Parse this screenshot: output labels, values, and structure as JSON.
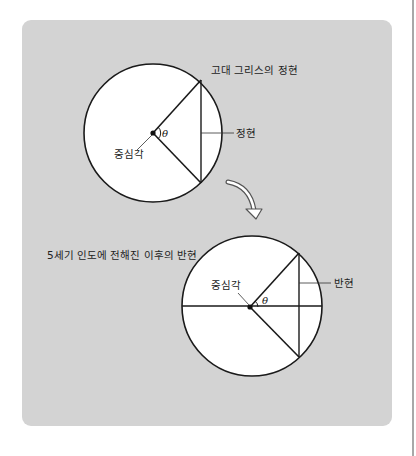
{
  "colors": {
    "page_background": "#ffffff",
    "card_background": "#d3d3d3",
    "circle_fill": "#ffffff",
    "stroke": "#1a1a1a",
    "right_rule": "#a8a8a8"
  },
  "top_diagram": {
    "title": "고대 그리스의 정현",
    "chord_label": "정현",
    "central_angle_label": "중심각",
    "angle_symbol": "θ"
  },
  "arrow": {
    "icon": "curved-down-arrow-icon"
  },
  "bottom_diagram": {
    "title": "5세기 인도에 전해진 이후의 반현",
    "half_chord_label": "반현",
    "central_angle_label": "중심각",
    "angle_symbol": "θ"
  }
}
